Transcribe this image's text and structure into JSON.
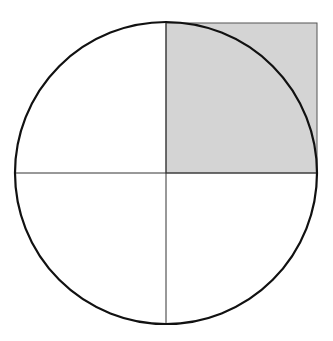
{
  "diagram": {
    "circle": {
      "cx": 166,
      "cy": 173,
      "r": 151,
      "stroke": "#111111",
      "stroke_width": 2.2
    },
    "diameters": {
      "stroke": "#333333",
      "stroke_width": 1
    },
    "shaded_square": {
      "x": 166,
      "y": 23,
      "size": 151,
      "fill": "#d4d4d4",
      "stroke": "#555555"
    },
    "background": "#ffffff"
  }
}
